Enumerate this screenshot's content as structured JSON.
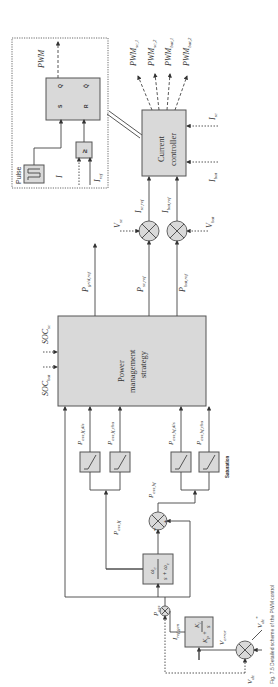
{
  "diagram": {
    "title": "Detailed scheme of the PWM control",
    "orientation": "rotated-90-ccw",
    "blocks": {
      "pwm_logic": {
        "pulse_label": "Pulse",
        "sr_s": "S",
        "sr_r": "R",
        "sr_q": "Q",
        "sr_qbar": "Q̄",
        "comparator": "≥",
        "output": "PWM",
        "input_i": "I",
        "input_iref": "I",
        "input_iref_sub": "ref"
      },
      "current_controller": {
        "line1": "Current",
        "line2": "controller"
      },
      "power_management": {
        "line1": "Power",
        "line2": "management",
        "line3": "strategy"
      },
      "lowpass_filter": {
        "num": "ω",
        "num_sub": "c",
        "den": "s + ω",
        "den_sub": "c"
      },
      "pi_controller": {
        "kp": "K",
        "kp_sub": "p",
        "plus": "+",
        "ki": "K",
        "ki_sub": "i",
        "s": "s"
      },
      "saturation": {
        "label": "Saturation"
      }
    },
    "outputs": [
      {
        "main": "PWM",
        "sub": "sc,1"
      },
      {
        "main": "PWM",
        "sub": "sc,2"
      },
      {
        "main": "PWM",
        "sub": "bat,1"
      },
      {
        "main": "PWM",
        "sub": "bat,2"
      }
    ],
    "signals": {
      "i_sc": {
        "main": "I",
        "sub": "sc"
      },
      "i_bat": {
        "main": "I",
        "sub": "bat"
      },
      "i_sc_ref": {
        "main": "I",
        "sub": "sc,ref"
      },
      "i_bat_ref": {
        "main": "I",
        "sub": "bat,ref"
      },
      "v_sc": {
        "main": "V",
        "sub": "sc"
      },
      "v_bat": {
        "main": "V",
        "sub": "bat"
      },
      "p_grid_ref": {
        "main": "P",
        "sub": "grid,ref"
      },
      "p_sc_ref": {
        "main": "P",
        "sub": "sc,ref"
      },
      "p_bat_ref": {
        "main": "P",
        "sub": "bat,ref"
      },
      "soc_bat": {
        "main": "SOC",
        "sub": "bat"
      },
      "soc_sc": {
        "main": "SOC",
        "sub": "sc"
      },
      "p_ess_lf_dis": {
        "main": "P",
        "sub": "ess,lf,dis"
      },
      "p_ess_lf_cha": {
        "main": "P",
        "sub": "ess,lf,cha"
      },
      "p_ess_hf_dis": {
        "main": "P",
        "sub": "ess,hf,dis"
      },
      "p_ess_hf_cha": {
        "main": "P",
        "sub": "ess,hf,cha"
      },
      "p_ess_lf": {
        "main": "P",
        "sub": "ess,lf"
      },
      "p_ess_hf": {
        "main": "P",
        "sub": "ess,hf"
      },
      "p_ess": {
        "main": "P",
        "sub": "ess"
      },
      "i_ref_gen": {
        "main": "I",
        "sub": "ref,gen"
      },
      "v_error": {
        "main": "V",
        "sub": "error"
      },
      "v_dc_ref": {
        "main": "V",
        "sub": "dc",
        "sup": "*"
      },
      "v_dc": {
        "main": "V",
        "sub": "dc"
      }
    },
    "summing_signs": {
      "sc": [
        "+",
        "×"
      ],
      "bat": [
        "+",
        "×"
      ],
      "hf": [
        "+",
        "−"
      ],
      "vdc": [
        "+",
        "−"
      ]
    },
    "caption": "Fig. 7.5 Detailed scheme of the PWM control"
  }
}
